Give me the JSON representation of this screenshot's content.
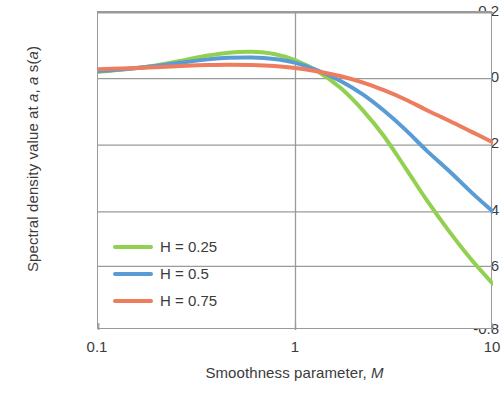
{
  "chart_data": {
    "type": "line",
    "title": "",
    "xlabel": "Smoothness parameter, M",
    "xlabel_plain": "Smoothness parameter,",
    "xlabel_italic": "M",
    "ylabel": "Spectral density value at a, a s(a)",
    "ylabel_parts": {
      "p1": "Spectral density value at ",
      "i1": "a",
      "p2": ", ",
      "i2": "a",
      "p3": " s(",
      "i3": "a",
      "p4": ")"
    },
    "xscale": "log",
    "yscale": "linear",
    "xlim": [
      0.1,
      10
    ],
    "ylim": [
      -0.8,
      0.2
    ],
    "grid": "horizontal",
    "legend_position": "inside-bottom-left",
    "xticks": [
      0.1,
      1,
      10
    ],
    "xtick_labels": [
      "0.1",
      "1",
      "10"
    ],
    "yticks": [
      0.2,
      0,
      -0.2,
      -0.4,
      -0.6,
      -0.8
    ],
    "ytick_labels": [
      "0.2",
      "0",
      "-0.2",
      "-0.4",
      "-0.6",
      "-0.8"
    ],
    "x": [
      0.1,
      0.13,
      0.17,
      0.22,
      0.28,
      0.36,
      0.46,
      0.6,
      0.78,
      1.0,
      1.3,
      1.7,
      2.2,
      2.8,
      3.6,
      4.6,
      6.0,
      7.8,
      10.0
    ],
    "series": [
      {
        "name": "H = 0.25",
        "color": "#92D050",
        "values": [
          0.012,
          0.018,
          0.026,
          0.037,
          0.05,
          0.063,
          0.072,
          0.075,
          0.068,
          0.048,
          0.013,
          -0.04,
          -0.11,
          -0.19,
          -0.29,
          -0.39,
          -0.49,
          -0.58,
          -0.655
        ]
      },
      {
        "name": "H = 0.5",
        "color": "#5B9BD5",
        "values": [
          0.014,
          0.019,
          0.026,
          0.034,
          0.043,
          0.051,
          0.056,
          0.057,
          0.052,
          0.04,
          0.016,
          -0.018,
          -0.06,
          -0.11,
          -0.17,
          -0.235,
          -0.3,
          -0.368,
          -0.428
        ]
      },
      {
        "name": "H = 0.75",
        "color": "#ED7D5E",
        "values": [
          0.02,
          0.022,
          0.025,
          0.028,
          0.031,
          0.033,
          0.034,
          0.033,
          0.03,
          0.024,
          0.013,
          -0.002,
          -0.022,
          -0.046,
          -0.075,
          -0.108,
          -0.142,
          -0.177,
          -0.21
        ]
      }
    ],
    "legend": [
      {
        "label": "H = 0.25",
        "color": "#92D050"
      },
      {
        "label": "H = 0.5",
        "color": "#5B9BD5"
      },
      {
        "label": "H = 0.75",
        "color": "#ED7D5E"
      }
    ],
    "colors": {
      "green": "#92D050",
      "blue": "#5B9BD5",
      "coral": "#ED7D5E",
      "axis": "#9a9a9a",
      "grid": "#9a9a9a",
      "text": "#3b3b3b",
      "background": "#ffffff"
    }
  }
}
